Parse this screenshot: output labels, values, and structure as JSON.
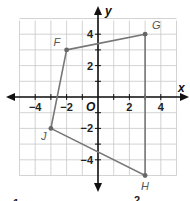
{
  "diagram": {
    "type": "coordinate-plane-quadrilateral",
    "axes": {
      "x_label": "x",
      "y_label": "y",
      "origin_label": "O",
      "x_ticks": [
        {
          "value": -4,
          "label": "−4"
        },
        {
          "value": -2,
          "label": "−2"
        },
        {
          "value": 2,
          "label": "2"
        },
        {
          "value": 4,
          "label": "4"
        }
      ],
      "y_ticks": [
        {
          "value": 4,
          "label": "4"
        },
        {
          "value": 2,
          "label": "2"
        },
        {
          "value": -2,
          "label": "−2"
        },
        {
          "value": -4,
          "label": "−4"
        }
      ],
      "x_range": [
        -5,
        5
      ],
      "y_range": [
        -5,
        5
      ],
      "grid": true
    },
    "points": [
      {
        "name": "F",
        "x": -2,
        "y": 3
      },
      {
        "name": "G",
        "x": 3,
        "y": 4
      },
      {
        "name": "H",
        "x": 3,
        "y": -5
      },
      {
        "name": "J",
        "x": -3,
        "y": -2
      }
    ],
    "polygon_order": [
      "F",
      "G",
      "H",
      "J"
    ],
    "colors": {
      "grid": "#c8c8c8",
      "axis": "#111111",
      "shape": "#777777",
      "point": "#666666"
    }
  },
  "footer_fragments": {
    "left": "1",
    "right": "2"
  }
}
